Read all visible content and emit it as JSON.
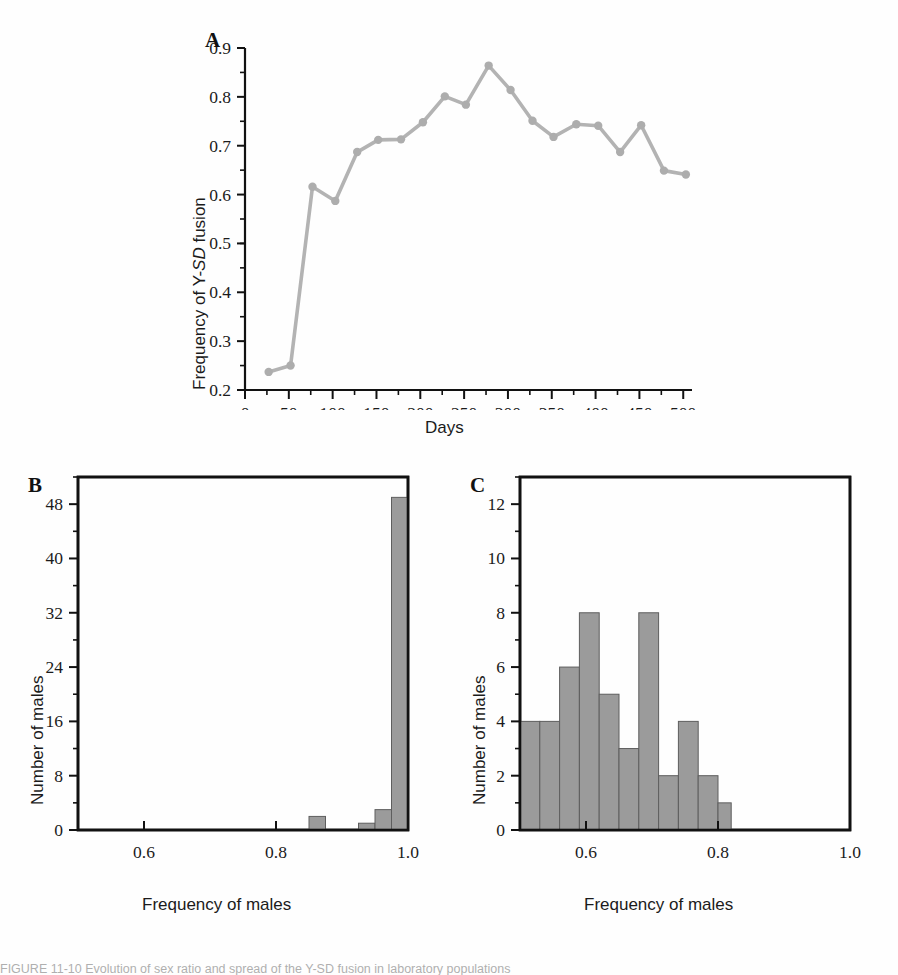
{
  "figure": {
    "caption_fragment": "FIGURE 11-10  Evolution of sex ratio and spread of the Y-SD fusion in laboratory populations",
    "panel_letters": {
      "a": "A",
      "b": "B",
      "c": "C"
    },
    "colors": {
      "line": "#b3b3b3",
      "marker": "#adadad",
      "bar_fill": "#9b9b9b",
      "axis": "#111111",
      "text": "#1b1b1b"
    }
  },
  "chart_data": [
    {
      "id": "panel_a",
      "type": "line",
      "title": "A",
      "xlabel": "Days",
      "ylabel": "Frequency of Y-SD fusion",
      "ylabel_italic_part": "SD",
      "xlim": [
        0,
        510
      ],
      "ylim": [
        0.2,
        0.9
      ],
      "grid": false,
      "legend": "none",
      "xticks": [
        0,
        50,
        100,
        150,
        200,
        250,
        300,
        350,
        400,
        450,
        500
      ],
      "xticklabels": [
        "0",
        "50",
        "100",
        "150",
        "200",
        "250",
        "300",
        "350",
        "400",
        "450",
        "500"
      ],
      "yticks": [
        0.2,
        0.3,
        0.4,
        0.5,
        0.6,
        0.7,
        0.8,
        0.9
      ],
      "yticklabels": [
        "0.2",
        "0.3",
        "0.4",
        "0.5",
        "0.6",
        "0.7",
        "0.8",
        "0.9"
      ],
      "y_minor_tick_step": 0.05,
      "x_minor_tick_step": 25,
      "x": [
        27,
        52,
        77,
        103,
        128,
        152,
        178,
        203,
        228,
        252,
        278,
        303,
        328,
        352,
        378,
        403,
        428,
        452,
        478,
        503
      ],
      "y": [
        0.237,
        0.25,
        0.616,
        0.587,
        0.687,
        0.712,
        0.713,
        0.748,
        0.801,
        0.784,
        0.864,
        0.814,
        0.751,
        0.718,
        0.744,
        0.741,
        0.687,
        0.742,
        0.649,
        0.641
      ]
    },
    {
      "id": "panel_b",
      "type": "bar",
      "title": "B",
      "xlabel": "Frequency of males",
      "ylabel": "Number of males",
      "xlim": [
        0.5,
        1.0
      ],
      "ylim": [
        0,
        52
      ],
      "grid": false,
      "legend": "none",
      "xticks": [
        0.6,
        0.8,
        1.0
      ],
      "xticklabels": [
        "0.6",
        "0.8",
        "1.0"
      ],
      "x_minor_tick_step": 0.05,
      "yticks": [
        0,
        8,
        16,
        24,
        32,
        40,
        48
      ],
      "yticklabels": [
        "0",
        "8",
        "16",
        "24",
        "32",
        "40",
        "48"
      ],
      "y_minor_tick_step": 4,
      "bin_width": 0.025,
      "bins": [
        {
          "left": 0.5,
          "right": 0.525,
          "count": 0
        },
        {
          "left": 0.525,
          "right": 0.55,
          "count": 0
        },
        {
          "left": 0.55,
          "right": 0.575,
          "count": 0
        },
        {
          "left": 0.575,
          "right": 0.6,
          "count": 0
        },
        {
          "left": 0.6,
          "right": 0.625,
          "count": 0
        },
        {
          "left": 0.625,
          "right": 0.65,
          "count": 0
        },
        {
          "left": 0.65,
          "right": 0.675,
          "count": 0
        },
        {
          "left": 0.675,
          "right": 0.7,
          "count": 0
        },
        {
          "left": 0.7,
          "right": 0.725,
          "count": 0
        },
        {
          "left": 0.725,
          "right": 0.75,
          "count": 0
        },
        {
          "left": 0.75,
          "right": 0.775,
          "count": 0
        },
        {
          "left": 0.775,
          "right": 0.8,
          "count": 0
        },
        {
          "left": 0.8,
          "right": 0.825,
          "count": 0
        },
        {
          "left": 0.825,
          "right": 0.85,
          "count": 0
        },
        {
          "left": 0.85,
          "right": 0.875,
          "count": 2
        },
        {
          "left": 0.875,
          "right": 0.9,
          "count": 0
        },
        {
          "left": 0.9,
          "right": 0.925,
          "count": 0
        },
        {
          "left": 0.925,
          "right": 0.95,
          "count": 1
        },
        {
          "left": 0.95,
          "right": 0.975,
          "count": 3
        },
        {
          "left": 0.975,
          "right": 1.0,
          "count": 49
        }
      ]
    },
    {
      "id": "panel_c",
      "type": "bar",
      "title": "C",
      "xlabel": "Frequency of males",
      "ylabel": "Number of males",
      "xlim": [
        0.5,
        1.0
      ],
      "ylim": [
        0,
        13
      ],
      "grid": false,
      "legend": "none",
      "xticks": [
        0.6,
        0.8,
        1.0
      ],
      "xticklabels": [
        "0.6",
        "0.8",
        "1.0"
      ],
      "x_minor_tick_step": 0.05,
      "yticks": [
        0,
        2,
        4,
        6,
        8,
        10,
        12
      ],
      "yticklabels": [
        "0",
        "2",
        "4",
        "6",
        "8",
        "10",
        "12"
      ],
      "y_minor_tick_step": 1,
      "bin_width": 0.03,
      "bins": [
        {
          "left": 0.5,
          "right": 0.53,
          "count": 4
        },
        {
          "left": 0.53,
          "right": 0.56,
          "count": 4
        },
        {
          "left": 0.56,
          "right": 0.59,
          "count": 6
        },
        {
          "left": 0.59,
          "right": 0.62,
          "count": 8
        },
        {
          "left": 0.62,
          "right": 0.65,
          "count": 5
        },
        {
          "left": 0.65,
          "right": 0.68,
          "count": 3
        },
        {
          "left": 0.68,
          "right": 0.71,
          "count": 8
        },
        {
          "left": 0.71,
          "right": 0.74,
          "count": 2
        },
        {
          "left": 0.74,
          "right": 0.77,
          "count": 4
        },
        {
          "left": 0.77,
          "right": 0.8,
          "count": 2
        },
        {
          "left": 0.8,
          "right": 0.82,
          "count": 1
        }
      ]
    }
  ]
}
